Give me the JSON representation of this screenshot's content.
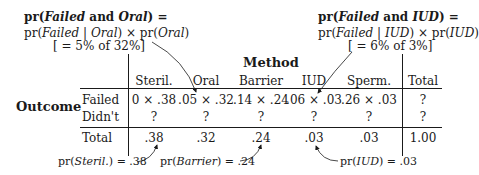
{
  "annotations": {
    "left": {
      "line1": {
        "pre": "pr(",
        "a": "Failed",
        "mid": " and ",
        "b": "Oral",
        "post": ") ="
      },
      "line2": {
        "pre": "pr(",
        "a": "Failed",
        "bar": " | ",
        "b": "Oral",
        "mid": ") × pr(",
        "c": "Oral",
        "post": ")"
      },
      "line3": "[ = 5% of 32%]"
    },
    "right": {
      "line1": {
        "pre": "pr(",
        "a": "Failed",
        "mid": " and ",
        "b": "IUD",
        "post": ") ="
      },
      "line2": {
        "pre": "pr(",
        "a": "Failed",
        "bar": " | ",
        "b": "IUD",
        "mid": ") × pr(",
        "c": "IUD",
        "post": ")"
      },
      "line3": "[ = 6% of 3%]"
    },
    "bottom": [
      {
        "pre": "pr(",
        "var": "Steril.",
        "post": ") = .38"
      },
      {
        "pre": "pr(",
        "var": "Barrier",
        "post": ") = .24"
      },
      {
        "pre": "pr(",
        "var": "IUD",
        "post": ") = .03"
      }
    ]
  },
  "table": {
    "column_group_label": "Method",
    "row_group_label": "Outcome",
    "columns": [
      "Steril.",
      "Oral",
      "Barrier",
      "IUD",
      "Sperm.",
      "Total"
    ],
    "rows": [
      {
        "label": "Failed",
        "cells": [
          "0 × .38",
          ".05 × .32",
          ".14 × .24",
          ".06 × .03",
          ".26 × .03",
          "?"
        ]
      },
      {
        "label": "Didn't",
        "cells": [
          "?",
          "?",
          "?",
          "?",
          "?",
          "?"
        ]
      }
    ],
    "total_row": {
      "label": "Total",
      "cells": [
        ".38",
        ".32",
        ".24",
        ".03",
        ".03",
        "1.00"
      ]
    }
  }
}
